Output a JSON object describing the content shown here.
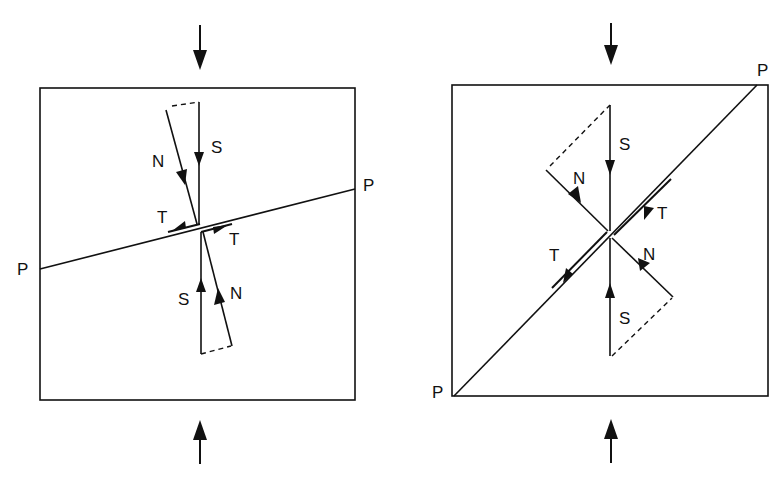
{
  "figure": {
    "panels": [
      {
        "id": "left",
        "description": "Plane P nearly perpendicular to compression; stress S resolved into normal N and small shear T",
        "labels": {
          "plane_left": "P",
          "plane_right": "P",
          "stress_top": "S",
          "normal_top": "N",
          "shear_top": "T",
          "shear_bottom": "T",
          "stress_bottom": "S",
          "normal_bottom": "N"
        }
      },
      {
        "id": "right",
        "description": "Plane P at 45 degrees to compression; stress S resolved into normal N and maximum shear T",
        "labels": {
          "plane_top": "P",
          "plane_bottom": "P",
          "stress_top": "S",
          "normal_top": "N",
          "shear_top": "T",
          "shear_bottom": "T",
          "stress_bottom": "S",
          "normal_bottom": "N"
        }
      }
    ],
    "colors": {
      "ink": "#111111",
      "background": "#ffffff"
    }
  }
}
